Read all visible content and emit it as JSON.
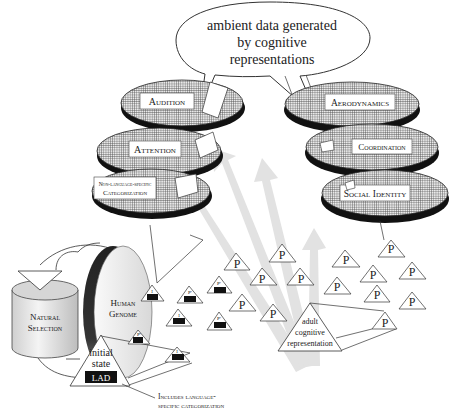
{
  "bubble": {
    "line1": "ambient data generated",
    "line2": "by cognitive",
    "line3": "representations"
  },
  "left_disks": [
    {
      "label": "Audition"
    },
    {
      "label": "Attention"
    },
    {
      "label_line1": "Non-language-specific",
      "label_line2": "Categorization"
    }
  ],
  "right_disks": [
    {
      "label": "Aerodynamics"
    },
    {
      "label": "Coordination"
    },
    {
      "label": "Social Identity"
    }
  ],
  "cylinder": {
    "line1": "Natural",
    "line2": "Selection"
  },
  "genome": {
    "line1": "Human",
    "line2": "Genome"
  },
  "initial_state": {
    "line1": "initial",
    "line2": "state",
    "box": "LAD"
  },
  "annotation": {
    "line1": "Includes language-",
    "line2": "specific categorization"
  },
  "adult": {
    "line1": "adult",
    "line2": "cognitive",
    "line3": "representation"
  },
  "p_label": "P",
  "small_top_labels": {
    "i": "I",
    "p_prime": "P'"
  },
  "colors": {
    "hatch": "#555555",
    "shadow": "#111111",
    "arrow": "#dcdcdc",
    "line": "#333333"
  }
}
